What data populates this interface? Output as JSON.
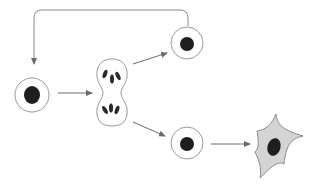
{
  "diagram": {
    "title": "",
    "colors": {
      "background": "#ffffff",
      "membrane": "#9a9a9a",
      "nucleus": "#1e1e1e",
      "arrow": "#6a6a6a",
      "differentiated_fill": "#d4d4d4",
      "differentiated_outline": "#8a8a8a"
    },
    "nodes": [
      {
        "id": "stem-cell",
        "type": "round-cell",
        "cx": 32,
        "cy": 95,
        "r": 17
      },
      {
        "id": "dividing-cell",
        "type": "mitotic-cell",
        "cx": 112,
        "cy": 92
      },
      {
        "id": "self-renewed-cell",
        "type": "round-cell",
        "cx": 187,
        "cy": 43,
        "r": 16
      },
      {
        "id": "progenitor-cell",
        "type": "round-cell",
        "cx": 187,
        "cy": 143,
        "r": 16
      },
      {
        "id": "differentiated-cell",
        "type": "stellate-cell",
        "cx": 276,
        "cy": 145
      }
    ],
    "edges": [
      {
        "from": "stem-cell",
        "to": "dividing-cell"
      },
      {
        "from": "dividing-cell",
        "to": "self-renewed-cell"
      },
      {
        "from": "dividing-cell",
        "to": "progenitor-cell"
      },
      {
        "from": "progenitor-cell",
        "to": "differentiated-cell"
      },
      {
        "from": "self-renewed-cell",
        "to": "stem-cell",
        "style": "feedback-loop"
      }
    ]
  }
}
